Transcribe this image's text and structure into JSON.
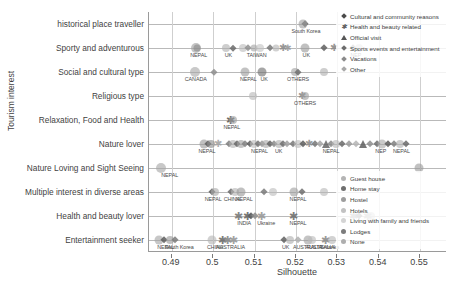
{
  "chart_data": {
    "type": "scatter",
    "title": "",
    "xlabel": "Silhouette",
    "ylabel": "Tourism interest",
    "xlim": [
      0.4845,
      0.5565
    ],
    "xticks": [
      0.49,
      0.5,
      0.51,
      0.52,
      0.53,
      0.54,
      0.55
    ],
    "xtick_labels": [
      "0.49",
      "0.5",
      "0.51",
      "0.52",
      "0.53",
      "0.54",
      "0.55"
    ],
    "grid": "both",
    "categories": [
      "historical place traveller",
      "Sporty and adventurous",
      "Social and cultural type",
      "Religious type",
      "Relaxation, Food and Health",
      "Nature lover",
      "Nature Loving and Sight Seeing",
      "Multiple interest in diverse areas",
      "Health and beauty lover",
      "Entertainment seeker"
    ],
    "legends": [
      {
        "name": "purpose-of-visit",
        "position": "top-right",
        "entries": [
          {
            "label": "Cultural and community reasons",
            "marker": "diamond",
            "color": "#4a4a4a"
          },
          {
            "label": "Health and beauty related",
            "marker": "star",
            "color": "#5e5e5e"
          },
          {
            "label": "Official visit",
            "marker": "triangle",
            "color": "#565656"
          },
          {
            "label": "Sports events and entertainment",
            "marker": "diamond",
            "color": "#6d6d6d"
          },
          {
            "label": "Vacations",
            "marker": "diamond",
            "color": "#8a8a8a"
          },
          {
            "label": "Other",
            "marker": "diamond",
            "color": "#a8a8a8"
          }
        ]
      },
      {
        "name": "accommodation-type",
        "position": "bottom-right",
        "entries": [
          {
            "label": "Guest house",
            "marker": "circle",
            "color": "#b4b4b4"
          },
          {
            "label": "Home stay",
            "marker": "circle",
            "color": "#6f6f6f"
          },
          {
            "label": "Hostel",
            "marker": "circle",
            "color": "#9d9d9d"
          },
          {
            "label": "Hotels",
            "marker": "circle",
            "color": "#c2c2c2"
          },
          {
            "label": "Living with family and friends",
            "marker": "circle",
            "color": "#d4d4d4"
          },
          {
            "label": "Lodges",
            "marker": "circle",
            "color": "#7c7c7c"
          },
          {
            "label": "None",
            "marker": "circle",
            "color": "#aeaeae"
          }
        ]
      }
    ],
    "point_labels": [
      {
        "text": "South Korea",
        "x": 0.5224,
        "y": "historical place traveller"
      },
      {
        "text": "NEPAL",
        "x": 0.4965,
        "y": "Sporty and adventurous"
      },
      {
        "text": "UK",
        "x": 0.5037,
        "y": "Sporty and adventurous"
      },
      {
        "text": "TAIWAN",
        "x": 0.5105,
        "y": "Sporty and adventurous"
      },
      {
        "text": "UK",
        "x": 0.5225,
        "y": "Sporty and adventurous"
      },
      {
        "text": "NEP",
        "x": 0.5345,
        "y": "Sporty and adventurous"
      },
      {
        "text": "CANADA",
        "x": 0.4958,
        "y": "Social and cultural type"
      },
      {
        "text": "NEPAL",
        "x": 0.5085,
        "y": "Social and cultural type"
      },
      {
        "text": "UK",
        "x": 0.5123,
        "y": "Social and cultural type"
      },
      {
        "text": "OTHERS",
        "x": 0.5205,
        "y": "Social and cultural type"
      },
      {
        "text": "OTHERS",
        "x": 0.5222,
        "y": "Religious type"
      },
      {
        "text": "NEPAL",
        "x": 0.5045,
        "y": "Relaxation, Food and Health"
      },
      {
        "text": "NEPAL",
        "x": 0.4985,
        "y": "Nature lover"
      },
      {
        "text": "NEPAL",
        "x": 0.5112,
        "y": "Nature lover"
      },
      {
        "text": "UK",
        "x": 0.5158,
        "y": "Nature lover"
      },
      {
        "text": "NEPAL",
        "x": 0.5285,
        "y": "Nature lover"
      },
      {
        "text": "NEP",
        "x": 0.5405,
        "y": "Nature lover"
      },
      {
        "text": "NEPAL",
        "x": 0.5455,
        "y": "Nature lover"
      },
      {
        "text": "NEPAL",
        "x": 0.4895,
        "y": "Nature Loving and Sight Seeing"
      },
      {
        "text": "NEPAL",
        "x": 0.5,
        "y": "Multiple interest in diverse areas"
      },
      {
        "text": "CHINA",
        "x": 0.5045,
        "y": "Multiple interest in diverse areas"
      },
      {
        "text": "NEPAL",
        "x": 0.5075,
        "y": "Multiple interest in diverse areas"
      },
      {
        "text": "NEPAL",
        "x": 0.5205,
        "y": "Multiple interest in diverse areas"
      },
      {
        "text": "INDIA",
        "x": 0.5075,
        "y": "Health and beauty lover"
      },
      {
        "text": "Ukraine",
        "x": 0.5128,
        "y": "Health and beauty lover"
      },
      {
        "text": "NEPAL",
        "x": 0.5205,
        "y": "Health and beauty lover"
      },
      {
        "text": "NEPAL",
        "x": 0.4885,
        "y": "Entertainment seeker"
      },
      {
        "text": "South Korea",
        "x": 0.4918,
        "y": "Entertainment seeker"
      },
      {
        "text": "CHINA",
        "x": 0.5005,
        "y": "Entertainment seeker"
      },
      {
        "text": "AUSTRALIA",
        "x": 0.5042,
        "y": "Entertainment seeker"
      },
      {
        "text": "UK",
        "x": 0.5175,
        "y": "Entertainment seeker"
      },
      {
        "text": "AUSTRALIA",
        "x": 0.5228,
        "y": "Entertainment seeker"
      },
      {
        "text": "Srilanka",
        "x": 0.5282,
        "y": "Entertainment seeker"
      },
      {
        "text": "AUSTRALIA",
        "x": 0.5258,
        "y": "Entertainment seeker"
      }
    ],
    "points": [
      {
        "x": 0.5222,
        "y": 0,
        "m": "diamond",
        "c": "#5a5a5a",
        "s": 7
      },
      {
        "x": 0.5216,
        "y": 0,
        "m": "circle",
        "c": "#9e9e9e",
        "s": 9
      },
      {
        "x": 0.4958,
        "y": 1,
        "m": "circle",
        "c": "#a0a0a0",
        "s": 10
      },
      {
        "x": 0.4962,
        "y": 1,
        "m": "circle",
        "c": "#8a8a8a",
        "s": 7
      },
      {
        "x": 0.5031,
        "y": 1,
        "m": "circle",
        "c": "#b0b0b0",
        "s": 8
      },
      {
        "x": 0.5048,
        "y": 1,
        "m": "diamond",
        "c": "#6a6a6a",
        "s": 6
      },
      {
        "x": 0.5073,
        "y": 1,
        "m": "circle",
        "c": "#bdbdbd",
        "s": 8
      },
      {
        "x": 0.5083,
        "y": 1,
        "m": "diamond",
        "c": "#8f8f8f",
        "s": 7
      },
      {
        "x": 0.5098,
        "y": 1,
        "m": "circle",
        "c": "#a5a5a5",
        "s": 7
      },
      {
        "x": 0.5112,
        "y": 1,
        "m": "circle",
        "c": "#c4c4c4",
        "s": 8
      },
      {
        "x": 0.5138,
        "y": 1,
        "m": "diamond",
        "c": "#777777",
        "s": 7
      },
      {
        "x": 0.5152,
        "y": 1,
        "m": "circle",
        "c": "#b5b5b5",
        "s": 7
      },
      {
        "x": 0.5168,
        "y": 1,
        "m": "star",
        "c": "#8c8c8c",
        "s": 8
      },
      {
        "x": 0.5181,
        "y": 1,
        "m": "star",
        "c": "#9a9a9a",
        "s": 7
      },
      {
        "x": 0.5222,
        "y": 1,
        "m": "circle",
        "c": "#9a9a9a",
        "s": 9
      },
      {
        "x": 0.5268,
        "y": 1,
        "m": "diamond",
        "c": "#5f5f5f",
        "s": 7
      },
      {
        "x": 0.5291,
        "y": 1,
        "m": "star",
        "c": "#8a8a8a",
        "s": 8
      },
      {
        "x": 0.5338,
        "y": 1,
        "m": "diamond",
        "c": "#6b6b6b",
        "s": 7
      },
      {
        "x": 0.5352,
        "y": 1,
        "m": "circle",
        "c": "#b0b0b0",
        "s": 8
      },
      {
        "x": 0.4955,
        "y": 2,
        "m": "circle",
        "c": "#a8a8a8",
        "s": 10
      },
      {
        "x": 0.5003,
        "y": 2,
        "m": "diamond",
        "c": "#8e8e8e",
        "s": 6
      },
      {
        "x": 0.5078,
        "y": 2,
        "m": "circle",
        "c": "#9c9c9c",
        "s": 9
      },
      {
        "x": 0.5118,
        "y": 2,
        "m": "circle",
        "c": "#6f6f6f",
        "s": 9
      },
      {
        "x": 0.5198,
        "y": 2,
        "m": "circle",
        "c": "#a2a2a2",
        "s": 8
      },
      {
        "x": 0.5205,
        "y": 2,
        "m": "diamond",
        "c": "#707070",
        "s": 6
      },
      {
        "x": 0.5268,
        "y": 2,
        "m": "circle",
        "c": "#b0b0b0",
        "s": 8
      },
      {
        "x": 0.5096,
        "y": 3,
        "m": "circle",
        "c": "#b8b8b8",
        "s": 8
      },
      {
        "x": 0.5215,
        "y": 3,
        "m": "star",
        "c": "#8a8a8a",
        "s": 8
      },
      {
        "x": 0.5222,
        "y": 3,
        "m": "circle",
        "c": "#a0a0a0",
        "s": 8
      },
      {
        "x": 0.5042,
        "y": 4,
        "m": "star",
        "c": "#5d5d5d",
        "s": 9
      },
      {
        "x": 0.5048,
        "y": 4,
        "m": "circle",
        "c": "#9e9e9e",
        "s": 8
      },
      {
        "x": 0.4978,
        "y": 5,
        "m": "circle",
        "c": "#9a9a9a",
        "s": 9
      },
      {
        "x": 0.4988,
        "y": 5,
        "m": "diamond",
        "c": "#5a5a5a",
        "s": 7
      },
      {
        "x": 0.4996,
        "y": 5,
        "m": "circle",
        "c": "#8d8d8d",
        "s": 8
      },
      {
        "x": 0.5012,
        "y": 5,
        "m": "star",
        "c": "#a5a5a5",
        "s": 8
      },
      {
        "x": 0.5038,
        "y": 5,
        "m": "diamond",
        "c": "#7c7c7c",
        "s": 7
      },
      {
        "x": 0.5048,
        "y": 5,
        "m": "circle",
        "c": "#b2b2b2",
        "s": 8
      },
      {
        "x": 0.5058,
        "y": 5,
        "m": "diamond",
        "c": "#666666",
        "s": 7
      },
      {
        "x": 0.5068,
        "y": 5,
        "m": "circle",
        "c": "#9f9f9f",
        "s": 8
      },
      {
        "x": 0.5078,
        "y": 5,
        "m": "diamond",
        "c": "#828282",
        "s": 7
      },
      {
        "x": 0.5088,
        "y": 5,
        "m": "diamond",
        "c": "#5e5e5e",
        "s": 7
      },
      {
        "x": 0.5098,
        "y": 5,
        "m": "circle",
        "c": "#bcbcbc",
        "s": 8
      },
      {
        "x": 0.5108,
        "y": 5,
        "m": "diamond",
        "c": "#747474",
        "s": 7
      },
      {
        "x": 0.5118,
        "y": 5,
        "m": "diamond",
        "c": "#999999",
        "s": 7
      },
      {
        "x": 0.5128,
        "y": 5,
        "m": "circle",
        "c": "#a8a8a8",
        "s": 8
      },
      {
        "x": 0.5138,
        "y": 5,
        "m": "diamond",
        "c": "#636363",
        "s": 7
      },
      {
        "x": 0.5148,
        "y": 5,
        "m": "diamond",
        "c": "#8c8c8c",
        "s": 7
      },
      {
        "x": 0.5158,
        "y": 5,
        "m": "circle",
        "c": "#b0b0b0",
        "s": 8
      },
      {
        "x": 0.5168,
        "y": 5,
        "m": "diamond",
        "c": "#6e6e6e",
        "s": 7
      },
      {
        "x": 0.5178,
        "y": 5,
        "m": "diamond",
        "c": "#a0a0a0",
        "s": 7
      },
      {
        "x": 0.5192,
        "y": 5,
        "m": "diamond",
        "c": "#787878",
        "s": 7
      },
      {
        "x": 0.5205,
        "y": 5,
        "m": "circle",
        "c": "#bbbbbb",
        "s": 8
      },
      {
        "x": 0.5218,
        "y": 5,
        "m": "diamond",
        "c": "#5c5c5c",
        "s": 7
      },
      {
        "x": 0.5232,
        "y": 5,
        "m": "star",
        "c": "#8f8f8f",
        "s": 8
      },
      {
        "x": 0.5245,
        "y": 5,
        "m": "diamond",
        "c": "#767676",
        "s": 7
      },
      {
        "x": 0.5258,
        "y": 5,
        "m": "diamond",
        "c": "#a4a4a4",
        "s": 7
      },
      {
        "x": 0.5272,
        "y": 5,
        "m": "triangle",
        "c": "#666666",
        "s": 8
      },
      {
        "x": 0.5285,
        "y": 5,
        "m": "diamond",
        "c": "#8a8a8a",
        "s": 7
      },
      {
        "x": 0.5298,
        "y": 5,
        "m": "circle",
        "c": "#b6b6b6",
        "s": 8
      },
      {
        "x": 0.5312,
        "y": 5,
        "m": "diamond",
        "c": "#6a6a6a",
        "s": 7
      },
      {
        "x": 0.5328,
        "y": 5,
        "m": "diamond",
        "c": "#999999",
        "s": 7
      },
      {
        "x": 0.5345,
        "y": 5,
        "m": "diamond",
        "c": "#b4b4b4",
        "s": 7
      },
      {
        "x": 0.5362,
        "y": 5,
        "m": "triangle",
        "c": "#5f5f5f",
        "s": 8
      },
      {
        "x": 0.5378,
        "y": 5,
        "m": "diamond",
        "c": "#8e8e8e",
        "s": 7
      },
      {
        "x": 0.5395,
        "y": 5,
        "m": "diamond",
        "c": "#6c6c6c",
        "s": 7
      },
      {
        "x": 0.5408,
        "y": 5,
        "m": "circle",
        "c": "#a9a9a9",
        "s": 9
      },
      {
        "x": 0.5422,
        "y": 5,
        "m": "diamond",
        "c": "#5a5a5a",
        "s": 7
      },
      {
        "x": 0.5438,
        "y": 5,
        "m": "diamond",
        "c": "#7f7f7f",
        "s": 7
      },
      {
        "x": 0.5452,
        "y": 5,
        "m": "circle",
        "c": "#b0b0b0",
        "s": 8
      },
      {
        "x": 0.5465,
        "y": 5,
        "m": "diamond",
        "c": "#686868",
        "s": 7
      },
      {
        "x": 0.4875,
        "y": 6,
        "m": "circle",
        "c": "#a6a6a6",
        "s": 10
      },
      {
        "x": 0.5498,
        "y": 6,
        "m": "circle",
        "c": "#9b9b9b",
        "s": 9
      },
      {
        "x": 0.4998,
        "y": 7,
        "m": "diamond",
        "c": "#5e5e5e",
        "s": 7
      },
      {
        "x": 0.5005,
        "y": 7,
        "m": "circle",
        "c": "#ababab",
        "s": 8
      },
      {
        "x": 0.5042,
        "y": 7,
        "m": "diamond",
        "c": "#6b6b6b",
        "s": 7
      },
      {
        "x": 0.5052,
        "y": 7,
        "m": "circle",
        "c": "#b4b4b4",
        "s": 8
      },
      {
        "x": 0.5068,
        "y": 7,
        "m": "circle",
        "c": "#9a9a9a",
        "s": 9
      },
      {
        "x": 0.5122,
        "y": 7,
        "m": "diamond",
        "c": "#7a7a7a",
        "s": 7
      },
      {
        "x": 0.5145,
        "y": 7,
        "m": "circle",
        "c": "#bdbdbd",
        "s": 8
      },
      {
        "x": 0.5196,
        "y": 7,
        "m": "circle",
        "c": "#a0a0a0",
        "s": 9
      },
      {
        "x": 0.5215,
        "y": 7,
        "m": "diamond",
        "c": "#6e6e6e",
        "s": 7
      },
      {
        "x": 0.5268,
        "y": 7,
        "m": "circle",
        "c": "#b8b8b8",
        "s": 8
      },
      {
        "x": 0.5062,
        "y": 8,
        "m": "star",
        "c": "#7a7a7a",
        "s": 9
      },
      {
        "x": 0.5082,
        "y": 8,
        "m": "star",
        "c": "#6a6a6a",
        "s": 9
      },
      {
        "x": 0.5092,
        "y": 8,
        "m": "diamond",
        "c": "#5e5e5e",
        "s": 7
      },
      {
        "x": 0.5102,
        "y": 8,
        "m": "diamond",
        "c": "#8c8c8c",
        "s": 7
      },
      {
        "x": 0.5118,
        "y": 8,
        "m": "star",
        "c": "#9a9a9a",
        "s": 9
      },
      {
        "x": 0.5195,
        "y": 8,
        "m": "star",
        "c": "#707070",
        "s": 9
      },
      {
        "x": 0.5338,
        "y": 8,
        "m": "star",
        "c": "#8a8a8a",
        "s": 9
      },
      {
        "x": 0.5352,
        "y": 8,
        "m": "diamond",
        "c": "#6b6b6b",
        "s": 7
      },
      {
        "x": 0.5372,
        "y": 8,
        "m": "star",
        "c": "#9e9e9e",
        "s": 9
      },
      {
        "x": 0.5382,
        "y": 8,
        "m": "circle",
        "c": "#b2b2b2",
        "s": 8
      },
      {
        "x": 0.4868,
        "y": 9,
        "m": "circle",
        "c": "#a4a4a4",
        "s": 9
      },
      {
        "x": 0.4882,
        "y": 9,
        "m": "diamond",
        "c": "#5c5c5c",
        "s": 7
      },
      {
        "x": 0.4895,
        "y": 9,
        "m": "circle",
        "c": "#9a9a9a",
        "s": 8
      },
      {
        "x": 0.4908,
        "y": 9,
        "m": "diamond",
        "c": "#7a7a7a",
        "s": 7
      },
      {
        "x": 0.4998,
        "y": 9,
        "m": "circle",
        "c": "#b4b4b4",
        "s": 9
      },
      {
        "x": 0.5022,
        "y": 9,
        "m": "star",
        "c": "#6e6e6e",
        "s": 9
      },
      {
        "x": 0.5035,
        "y": 9,
        "m": "star",
        "c": "#8a8a8a",
        "s": 9
      },
      {
        "x": 0.5048,
        "y": 9,
        "m": "star",
        "c": "#999999",
        "s": 9
      },
      {
        "x": 0.5172,
        "y": 9,
        "m": "diamond",
        "c": "#5f5f5f",
        "s": 7
      },
      {
        "x": 0.5185,
        "y": 9,
        "m": "circle",
        "c": "#aeaeae",
        "s": 8
      },
      {
        "x": 0.5205,
        "y": 9,
        "m": "diamond",
        "c": "#b0b0b0",
        "s": 7
      },
      {
        "x": 0.5228,
        "y": 9,
        "m": "circle",
        "c": "#a0a0a0",
        "s": 9
      },
      {
        "x": 0.5238,
        "y": 9,
        "m": "circle",
        "c": "#bbbbbb",
        "s": 8
      },
      {
        "x": 0.5272,
        "y": 9,
        "m": "star",
        "c": "#8e8e8e",
        "s": 9
      },
      {
        "x": 0.5288,
        "y": 9,
        "m": "circle",
        "c": "#b6b6b6",
        "s": 8
      }
    ]
  }
}
